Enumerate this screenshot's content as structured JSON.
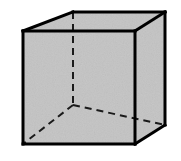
{
  "figure": {
    "shape_name": "cube",
    "projection": "oblique",
    "background_color": "#ffffff",
    "face_fill_color": "#c8c8c8",
    "edge_color": "#000000",
    "hidden_edge_style": "dashed",
    "visible_edge_width": 3,
    "hidden_edge_width": 2,
    "dash_pattern": "7 5",
    "vertices": {
      "front_top_left": [
        23,
        31
      ],
      "front_top_right": [
        135,
        31
      ],
      "front_bottom_right": [
        135,
        144
      ],
      "front_bottom_left": [
        23,
        144
      ],
      "back_top_left": [
        73,
        12
      ],
      "back_top_right": [
        165,
        12
      ],
      "back_bottom_right": [
        165,
        125
      ],
      "back_bottom_left_hidden": [
        73,
        105
      ]
    },
    "visible_edges": [
      "front_top_left-front_top_right",
      "front_top_right-front_bottom_right",
      "front_bottom_right-front_bottom_left",
      "front_bottom_left-front_top_left",
      "front_top_left-back_top_left",
      "front_top_right-back_top_right",
      "front_bottom_right-back_bottom_right",
      "back_top_left-back_top_right",
      "back_top_right-back_bottom_right"
    ],
    "hidden_edges": [
      "back_top_left-back_bottom_left_hidden",
      "back_bottom_left_hidden-back_bottom_right",
      "back_bottom_left_hidden-front_bottom_left"
    ],
    "face_labels": {
      "front": "front face",
      "top": "top face",
      "right": "right face"
    }
  }
}
